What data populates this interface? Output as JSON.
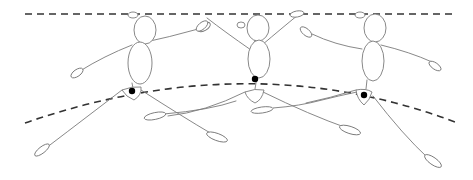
{
  "diagram": {
    "colors": {
      "background": "#ffffff",
      "figure_line": "#7a7a7a",
      "guide_line": "#333333",
      "pelvis_dot": "#000000"
    },
    "top_line": {
      "x1": 25,
      "y1": 14,
      "x2": 455,
      "y2": 14
    },
    "arc": {
      "path": "M25,123 Q250,45 455,122"
    },
    "figures": [
      {
        "id": "figure-1",
        "head": {
          "cx": 145,
          "cy": 30,
          "rx": 11,
          "ry": 14
        },
        "hair": {
          "cx": 133,
          "cy": 15,
          "rx": 5,
          "ry": 3
        },
        "torso": {
          "cx": 140,
          "cy": 63,
          "rx": 12,
          "ry": 21
        },
        "neck": "M139,42 L137,45",
        "pelvis": "M122,90 Q132,86 141,87 Q142,95 134,100 Q126,97 122,90 Z",
        "pelvis_dot": {
          "cx": 132,
          "cy": 91,
          "r": 3.2
        },
        "arm_left": "M132,45 Q104,56 80,71",
        "hand_left": {
          "cx": 77,
          "cy": 73,
          "rx": 7,
          "ry": 3.4,
          "rot": -35
        },
        "arm_right": "M137,44 Q170,37 202,28",
        "hand_right": {
          "cx": 204,
          "cy": 27,
          "rx": 7,
          "ry": 3.6,
          "rot": -30
        },
        "torso_link": "M132,83 L133,88",
        "leg_back": "M122,90 Q92,113 46,148",
        "foot_back": {
          "cx": 42,
          "cy": 150,
          "rx": 9,
          "ry": 3.2,
          "rot": -38
        },
        "leg_front": "M141,90 Q183,117 212,134",
        "foot_front": {
          "cx": 217,
          "cy": 137,
          "rx": 11,
          "ry": 3.6,
          "rot": 20
        },
        "leg_extra": "M164,114 Q210,110 236,101",
        "foot_extra": {
          "cx": 155,
          "cy": 116,
          "rx": 11,
          "ry": 3.4,
          "rot": -12
        }
      },
      {
        "id": "figure-2",
        "head": {
          "cx": 258,
          "cy": 28,
          "rx": 11,
          "ry": 13
        },
        "hair": {
          "cx": 241,
          "cy": 25,
          "rx": 4,
          "ry": 3
        },
        "torso": {
          "cx": 259,
          "cy": 59,
          "rx": 11,
          "ry": 19
        },
        "neck": "M255,40 L254,43",
        "pelvis": "M245,92 Q255,88 264,90 Q262,100 255,103 Q247,99 245,92 Z",
        "pelvis_dot": {
          "cx": 255,
          "cy": 79,
          "r": 3.2
        },
        "arm_left": "M251,50 Q225,32 207,18",
        "hand_left": {
          "cx": 202,
          "cy": 26,
          "rx": 7,
          "ry": 3.4,
          "rot": -40
        },
        "arm_right": "M262,45 Q282,28 298,15",
        "hand_right": {
          "cx": 297,
          "cy": 14,
          "rx": 7,
          "ry": 3,
          "rot": -10
        },
        "torso_link": "M257,77 L255,89",
        "leg_back": "M245,92 Q205,112 168,116",
        "foot_back": {
          "cx": 262,
          "cy": 110,
          "rx": 11,
          "ry": 3,
          "rot": -8
        },
        "leg_front": "M263,92 Q310,115 347,128",
        "foot_front": {
          "cx": 350,
          "cy": 130,
          "rx": 11,
          "ry": 3.6,
          "rot": 18
        },
        "leg_extra": "M273,108 Q300,106 322,100 Q338,96 357,92",
        "foot_extra": null
      },
      {
        "id": "figure-3",
        "head": {
          "cx": 375,
          "cy": 28,
          "rx": 11,
          "ry": 14
        },
        "hair": {
          "cx": 360,
          "cy": 15,
          "rx": 5,
          "ry": 3
        },
        "torso": {
          "cx": 373,
          "cy": 61,
          "rx": 11,
          "ry": 20
        },
        "neck": "M370,43 L367,47",
        "pelvis": "M356,90 Q366,88 372,92 Q370,100 364,105 Q357,99 356,90 Z",
        "pelvis_dot": {
          "cx": 364,
          "cy": 95,
          "r": 3.2
        },
        "arm_left": "M362,49 Q335,45 312,34",
        "hand_left": {
          "cx": 306,
          "cy": 32,
          "rx": 7,
          "ry": 3.4,
          "rot": 40
        },
        "arm_right": "M381,45 Q410,52 432,62",
        "hand_right": {
          "cx": 435,
          "cy": 66,
          "rx": 7,
          "ry": 3.2,
          "rot": 35
        },
        "torso_link": "M367,80 L366,89",
        "leg_back": "M356,90 Q330,98 306,103",
        "foot_back": null,
        "leg_front": "M373,96 Q403,135 428,158",
        "foot_front": {
          "cx": 433,
          "cy": 161,
          "rx": 10,
          "ry": 3.6,
          "rot": 35
        },
        "leg_extra": null,
        "foot_extra": null
      }
    ]
  }
}
